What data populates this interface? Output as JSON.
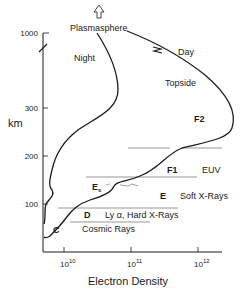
{
  "figure": {
    "y_axis_label": "km",
    "x_axis_label": "Electron Density",
    "y_ticks": [
      "1000",
      "300",
      "200",
      "100"
    ],
    "x_ticks": [
      {
        "base": "10",
        "exp": "10"
      },
      {
        "base": "10",
        "exp": "11"
      },
      {
        "base": "10",
        "exp": "12"
      }
    ],
    "top_label": "Plasmasphere",
    "profiles": {
      "night": "Night",
      "day": "Day"
    },
    "regions": {
      "topside": "Topside",
      "f2": "F2",
      "f1": "F1",
      "e": "E",
      "es_base": "E",
      "es_sub": "s",
      "d": "D",
      "c": "C"
    },
    "sources": {
      "euv": "EUV",
      "soft_xrays": "Soft X-Rays",
      "lyman_hard_xrays": "Ly α, Hard X-Rays",
      "cosmic_rays": "Cosmic Rays"
    },
    "colors": {
      "curve": "#1a1a1a",
      "boundary_lines": "#8a8a8a",
      "axis": "#1a1a1a"
    }
  }
}
